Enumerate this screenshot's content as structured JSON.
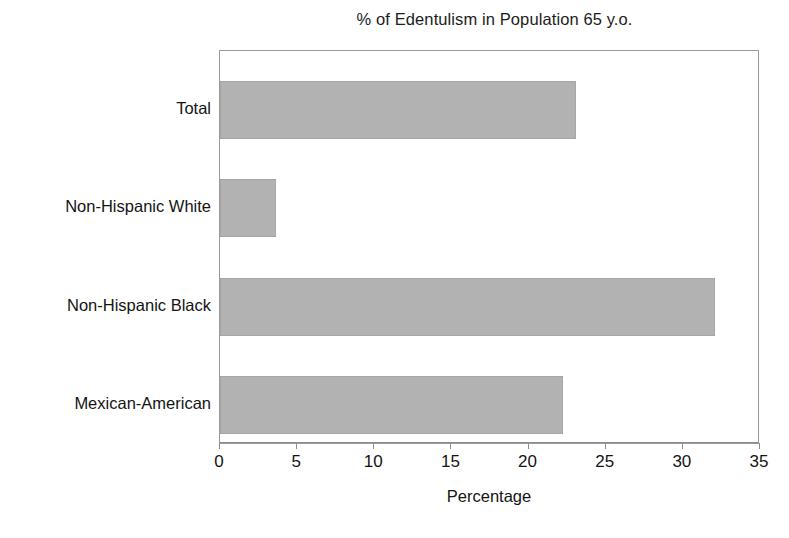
{
  "chart_data": {
    "type": "bar",
    "orientation": "horizontal",
    "title": "% of Edentulism in Population 65 y.o.",
    "xlabel": "Percentage",
    "ylabel": "",
    "categories": [
      "Total",
      "Non-Hispanic White",
      "Non-Hispanic Black",
      "Mexican-American"
    ],
    "values": [
      23.1,
      3.6,
      32.1,
      22.2
    ],
    "series": [
      {
        "name": "Percentage",
        "values": [
          23.1,
          3.6,
          32.1,
          22.2
        ],
        "color": "#b2b2b2"
      }
    ],
    "xlim": [
      0,
      35
    ],
    "xticks": [
      0,
      5,
      10,
      15,
      20,
      25,
      30,
      35
    ],
    "xtick_labels": [
      "0",
      "5",
      "10",
      "15",
      "20",
      "25",
      "30",
      "35"
    ],
    "grid": false,
    "legend": false,
    "bar_color": "#b2b2b2",
    "bar_edge_color": "#a6a6a6",
    "frame_color": "#8e8e8e",
    "background": "#ffffff",
    "category_order_top_to_bottom": [
      "Total",
      "Non-Hispanic White",
      "Non-Hispanic Black",
      "Mexican-American"
    ]
  },
  "scan_artifact": {
    "bottom_clipped_text": ""
  }
}
